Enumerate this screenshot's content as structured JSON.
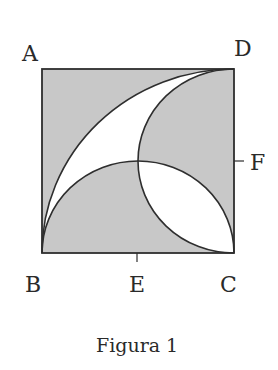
{
  "figure": {
    "caption": "Figura 1",
    "labels": {
      "A": "A",
      "B": "B",
      "C": "C",
      "D": "D",
      "E": "E",
      "F": "F"
    },
    "colors": {
      "shade": "#c8c8c8",
      "line": "#2e2e2e",
      "background": "#ffffff"
    }
  }
}
